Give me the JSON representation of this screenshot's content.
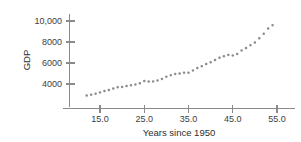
{
  "chart_data": {
    "type": "scatter",
    "title": "",
    "xlabel": "Years since 1950",
    "ylabel": "GDP",
    "xlim": [
      11,
      57
    ],
    "ylim": [
      2500,
      11000
    ],
    "grid": false,
    "legend": null,
    "marker_color": "#8c8c8c",
    "axis_color": "#8a8a8a",
    "xticks": [
      15.0,
      25.0,
      35.0,
      45.0,
      55.0
    ],
    "xtick_labels": [
      "15.0",
      "25.0",
      "35.0",
      "45.0",
      "55.0"
    ],
    "yticks": [
      4000,
      6000,
      8000,
      10000
    ],
    "ytick_labels": [
      "4000",
      "6000",
      "8000",
      "10,000"
    ],
    "x": [
      12,
      13,
      14,
      15,
      16,
      17,
      18,
      19,
      20,
      21,
      22,
      23,
      24,
      25,
      26,
      27,
      28,
      29,
      30,
      31,
      32,
      33,
      34,
      35,
      36,
      37,
      38,
      39,
      40,
      41,
      42,
      43,
      44,
      45,
      46,
      47,
      48,
      49,
      50,
      51,
      52,
      53,
      54
    ],
    "y": [
      2900,
      2980,
      3080,
      3200,
      3330,
      3430,
      3560,
      3680,
      3720,
      3800,
      3870,
      3960,
      4060,
      4280,
      4230,
      4250,
      4340,
      4480,
      4700,
      4840,
      4960,
      5000,
      5080,
      5080,
      5290,
      5520,
      5700,
      5900,
      6060,
      6280,
      6500,
      6640,
      6770,
      6720,
      6860,
      7200,
      7420,
      7700,
      7950,
      8350,
      8780,
      9280,
      9600,
      9920,
      10150,
      10500
    ]
  },
  "axis_titles": {
    "x": "Years since 1950",
    "y": "GDP"
  }
}
